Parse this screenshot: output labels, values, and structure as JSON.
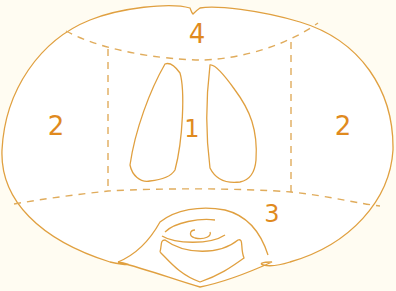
{
  "diagram": {
    "type": "anatomical cross-section zones",
    "colors": {
      "stroke": "#e0a040",
      "label": "#e08a1e",
      "background": "#fffcf2",
      "inside": "#ffffff"
    },
    "zones": [
      {
        "id": "zone-1",
        "label": "1"
      },
      {
        "id": "zone-2-left",
        "label": "2"
      },
      {
        "id": "zone-2-right",
        "label": "2"
      },
      {
        "id": "zone-3",
        "label": "3"
      },
      {
        "id": "zone-4",
        "label": "4"
      }
    ]
  }
}
